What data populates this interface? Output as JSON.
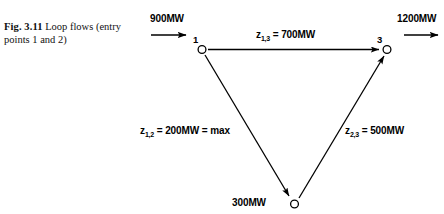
{
  "figure": {
    "caption_label": "Fig. 3.11",
    "caption_text": "Loop flows (entry points 1 and 2)",
    "background_color": "#ffffff",
    "line_color": "#000000"
  },
  "diagram": {
    "type": "network-flow-diagram",
    "nodes": [
      {
        "id": "1",
        "label": "1",
        "x": 202,
        "y": 50,
        "role": "entry-point"
      },
      {
        "id": "2",
        "label": "2",
        "x": 294,
        "y": 204,
        "role": "entry-point"
      },
      {
        "id": "3",
        "label": "3",
        "x": 387,
        "y": 50,
        "role": "exit-point"
      }
    ],
    "edges": [
      {
        "id": "z13",
        "from": "1",
        "to": "3",
        "label": "z",
        "subscript": "1,3",
        "value_text": "= 700MW",
        "value": 700,
        "unit": "MW"
      },
      {
        "id": "z12",
        "from": "1",
        "to": "2",
        "label": "z",
        "subscript": "1,2",
        "value_text": "= 200MW = max",
        "value": 200,
        "unit": "MW"
      },
      {
        "id": "z23",
        "from": "2",
        "to": "3",
        "label": "z",
        "subscript": "2,3",
        "value_text": "= 500MW",
        "value": 500,
        "unit": "MW"
      }
    ],
    "external_flows": [
      {
        "id": "inflow-1",
        "label": "900MW",
        "value": 900,
        "unit": "MW",
        "direction": "right",
        "attached_node": "1",
        "kind": "inflow"
      },
      {
        "id": "inflow-2",
        "label": "300MW",
        "value": 300,
        "unit": "MW",
        "direction": "right",
        "attached_node": "2",
        "kind": "inflow"
      },
      {
        "id": "outflow-3",
        "label": "1200MW",
        "value": 1200,
        "unit": "MW",
        "direction": "right",
        "attached_node": "3",
        "kind": "outflow"
      }
    ]
  }
}
